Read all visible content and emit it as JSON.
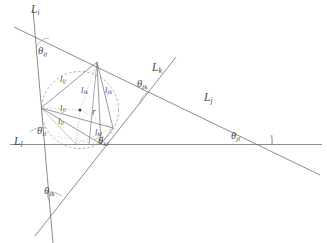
{
  "figure": {
    "type": "geometry-diagram",
    "width": 327,
    "height": 243,
    "background_color": "#ffffff",
    "stroke_color": "#6b6b6b",
    "label_color": "#4a4a4a"
  },
  "lines": [
    {
      "id": "Li",
      "name": "L",
      "sub": "i",
      "label": "Li"
    },
    {
      "id": "Lj",
      "name": "L",
      "sub": "j",
      "label": "Lj"
    },
    {
      "id": "Lk",
      "name": "L",
      "sub": "k",
      "label": "Lk"
    },
    {
      "id": "Ll",
      "name": "L",
      "sub": "l",
      "label": "Ll"
    }
  ],
  "line_labels": {
    "Li": {
      "base": "L",
      "sub": "i"
    },
    "Lj": {
      "base": "L",
      "sub": "j"
    },
    "Lk": {
      "base": "L",
      "sub": "k"
    },
    "Ll": {
      "base": "L",
      "sub": "l"
    }
  },
  "angles": [
    {
      "id": "theta_ij",
      "base": "θ",
      "sub": "ij",
      "between": [
        "Li",
        "Lj"
      ]
    },
    {
      "id": "theta_jk",
      "base": "θ",
      "sub": "jk",
      "between": [
        "Lj",
        "Lk"
      ]
    },
    {
      "id": "theta_jl",
      "base": "θ",
      "sub": "jl",
      "between": [
        "Lj",
        "Ll"
      ]
    },
    {
      "id": "theta_il",
      "base": "θ",
      "sub": "il",
      "between": [
        "Li",
        "Ll"
      ]
    },
    {
      "id": "theta_kl",
      "base": "θ",
      "sub": "kl",
      "between": [
        "Lk",
        "Ll"
      ]
    },
    {
      "id": "theta_ik",
      "base": "θ",
      "sub": "ik",
      "between": [
        "Li",
        "Lk"
      ]
    }
  ],
  "lengths": [
    {
      "id": "l_ij",
      "base": "l",
      "sub": "ij"
    },
    {
      "id": "l_ik",
      "base": "l",
      "sub": "ik"
    },
    {
      "id": "l_jk",
      "base": "l",
      "sub": "jk"
    },
    {
      "id": "l_jl",
      "base": "l",
      "sub": "jl"
    },
    {
      "id": "l_il",
      "base": "l",
      "sub": "il"
    },
    {
      "id": "l_kl",
      "base": "l",
      "sub": "kl"
    }
  ],
  "radius": {
    "id": "r",
    "base": "r",
    "sub": ""
  },
  "vertices": [
    {
      "id": "P_ij",
      "x": 97,
      "y": 62,
      "lines": [
        "Li",
        "Lj"
      ]
    },
    {
      "id": "P_il",
      "x": 41,
      "y": 108,
      "lines": [
        "Li",
        "Ll"
      ]
    },
    {
      "id": "P_jk",
      "x": 113,
      "y": 128,
      "lines": [
        "Lj",
        "Lk"
      ]
    },
    {
      "id": "P_kl",
      "x": 101,
      "y": 144,
      "lines": [
        "Lk",
        "Ll"
      ]
    }
  ],
  "circle": {
    "cx": 80,
    "cy": 110,
    "r": 38
  },
  "center_point": {
    "x": 80,
    "y": 110
  }
}
